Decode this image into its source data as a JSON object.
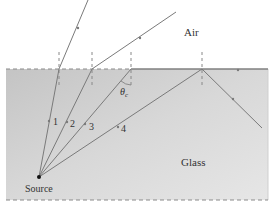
{
  "diagram": {
    "labels": {
      "air": "Air",
      "glass": "Glass",
      "source": "Source",
      "critical_angle": "θ",
      "critical_angle_sub": "c"
    },
    "rays": [
      {
        "id": "1",
        "label": "1",
        "behavior": "refracted into air"
      },
      {
        "id": "2",
        "label": "2",
        "behavior": "refracted into air"
      },
      {
        "id": "3",
        "label": "3",
        "behavior": "at critical angle, travels along surface"
      },
      {
        "id": "4",
        "label": "4",
        "behavior": "totally internally reflected"
      }
    ],
    "colors": {
      "glass_fill": "#c9c9c9",
      "ray": "#7a7a7a",
      "normal": "#888888",
      "text": "#333333"
    }
  }
}
